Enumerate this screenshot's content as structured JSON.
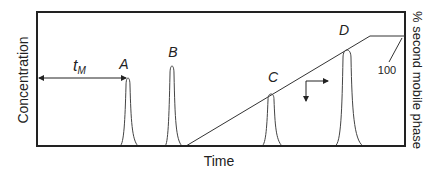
{
  "diagram": {
    "type": "gradient-elution-chromatogram",
    "x_axis_label": "Time",
    "y_axis_label": "Concentration",
    "right_axis_label": "% second mobile phase",
    "gradient_max_label": "100",
    "dead_time_label": "t",
    "dead_time_subscript": "M",
    "peaks": [
      {
        "label": "A",
        "x": 128,
        "top": 78,
        "width": 5
      },
      {
        "label": "B",
        "x": 172,
        "top": 66,
        "width": 5
      },
      {
        "label": "C",
        "x": 271,
        "top": 94,
        "width": 6
      },
      {
        "label": "D",
        "x": 347,
        "top": 50,
        "width": 7
      }
    ],
    "colors": {
      "frame": "#222222",
      "curve": "#444444",
      "background": "#ffffff"
    }
  }
}
